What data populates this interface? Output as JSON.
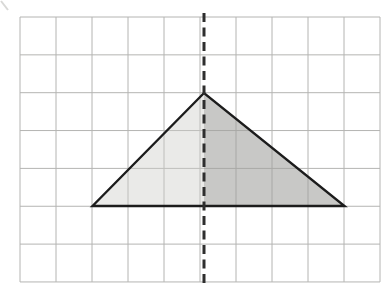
{
  "figure": {
    "canvas": {
      "width": 391,
      "height": 292,
      "background": "#ffffff"
    },
    "grid": {
      "x0": 20,
      "y0": 17,
      "cols": 10,
      "rows": 7,
      "cell_w": 36,
      "cell_h": 37.85,
      "line_color": "#b4b4b2",
      "line_width": 1
    },
    "triangle": {
      "vertices_px": {
        "left": [
          92.5,
          206
        ],
        "apex": [
          204,
          93
        ],
        "right": [
          344.5,
          206
        ]
      },
      "vertices_grid_units": {
        "left": [
          2,
          5
        ],
        "apex": [
          5.1,
          2
        ],
        "right": [
          9,
          5
        ]
      },
      "outline_color": "#1c1c1c",
      "outline_width": 2.4,
      "left_half_fill": "rgba(205,205,200,0.42)",
      "right_half_fill": "rgba(160,160,157,0.58)"
    },
    "symmetry_line": {
      "x": 204,
      "y1": 13,
      "y2": 287,
      "color": "#2e2e2e",
      "width": 3,
      "dash_pattern": "9 5.5"
    },
    "corner_mark": {
      "x1": 1,
      "y1": 1,
      "x2": 8,
      "y2": 10,
      "color": "#d9d9d7",
      "width": 2
    }
  }
}
